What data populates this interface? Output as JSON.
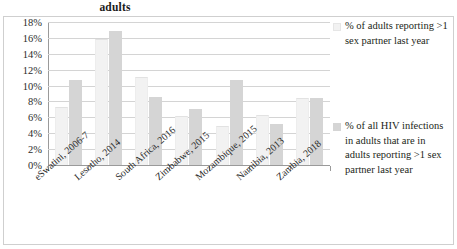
{
  "chart_data": {
    "type": "bar",
    "title": "adults",
    "xlabel": "",
    "ylabel": "",
    "ylim": [
      0,
      18
    ],
    "ytick_labels": [
      "18%",
      "16%",
      "14%",
      "12%",
      "10%",
      "8%",
      "6%",
      "4%",
      "2%",
      "0%"
    ],
    "ytick_values": [
      18,
      16,
      14,
      12,
      10,
      8,
      6,
      4,
      2,
      0
    ],
    "grid": true,
    "legend_position": "right",
    "categories": [
      "eSwatini, 2006-7",
      "Lesotho, 2014",
      "South Africa, 2016",
      "Zimbabwe, 2015",
      "Mozambique, 2015",
      "Namibia, 2013",
      "Zambia, 2018"
    ],
    "series": [
      {
        "name": "% of adults reporting >1 sex partner last year",
        "color": "#f2f2f2",
        "values": [
          7.3,
          15.8,
          11.1,
          6.2,
          4.9,
          6.3,
          8.4
        ]
      },
      {
        "name": "% of all HIV infections in adults that are in adults reporting >1 sex partner last year",
        "color": "#d5d5d5",
        "values": [
          10.7,
          16.9,
          8.6,
          7.1,
          10.7,
          5.1,
          8.4
        ]
      }
    ]
  },
  "legend": {
    "entries": [
      {
        "label": "% of adults reporting >1 sex partner last year",
        "swatch": "series-a-swatch"
      },
      {
        "label": "% of all HIV infections in adults that are in adults reporting >1 sex partner last year",
        "swatch": "series-b-swatch"
      }
    ]
  }
}
